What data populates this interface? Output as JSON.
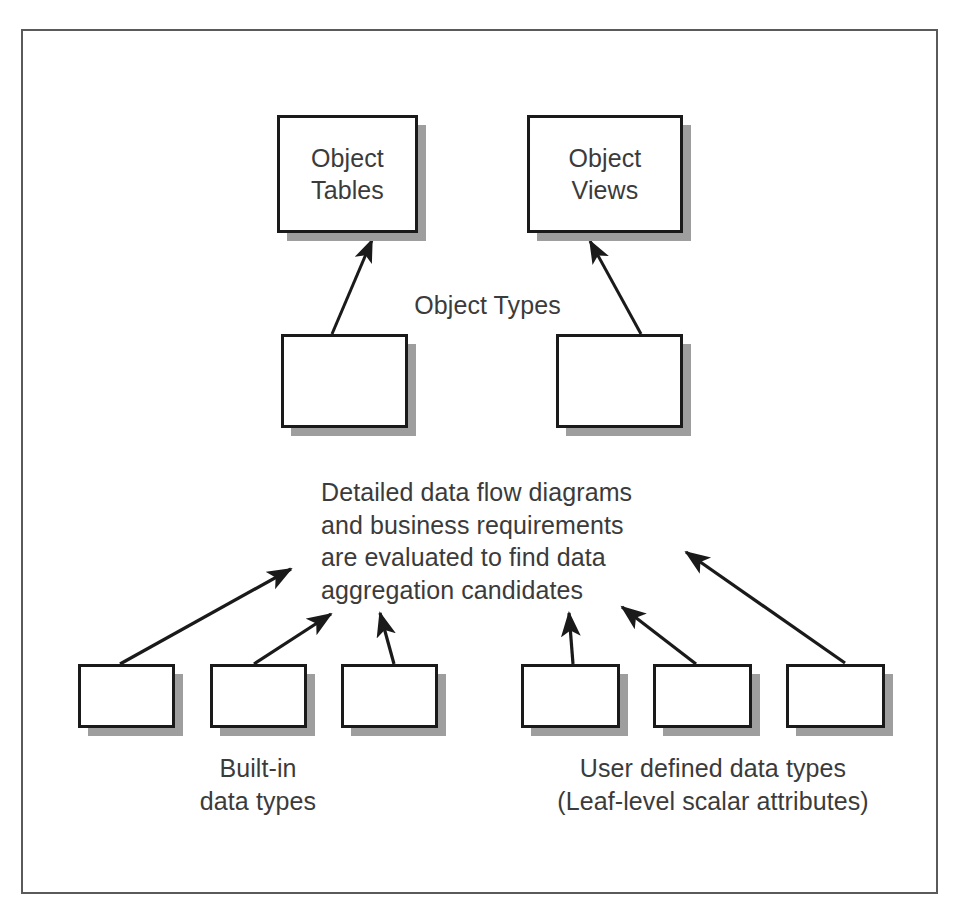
{
  "figure": {
    "type": "block-diagram",
    "background_color": "#ffffff",
    "frame_color": "#5a5a5a",
    "box_border_color": "#1a1a1a",
    "box_fill_color": "#ffffff",
    "shadow_color": "#9e9e9e",
    "text_color": "#3b3b3b",
    "arrow_color": "#1a1a1a"
  },
  "nodes": {
    "object_tables": "Object\nTables",
    "object_views": "Object\nViews",
    "object_type_left": "",
    "object_type_right": "",
    "builtin_box_1": "",
    "builtin_box_2": "",
    "builtin_box_3": "",
    "userdef_box_1": "",
    "userdef_box_2": "",
    "userdef_box_3": ""
  },
  "labels": {
    "object_types": "Object Types",
    "aggregation_note": "Detailed data flow diagrams\nand business requirements\nare evaluated to find data\naggregation candidates",
    "builtin_caption": "Built-in\ndata types",
    "userdefined_caption": "User defined data types\n(Leaf-level scalar attributes)"
  },
  "connectors": [
    {
      "name": "objecttype-left-to-object-tables",
      "from": "object_type_left",
      "to": "object_tables",
      "arrow": true
    },
    {
      "name": "objecttype-right-to-object-views",
      "from": "object_type_right",
      "to": "object_views",
      "arrow": true
    },
    {
      "name": "builtin-1-to-note",
      "from": "builtin_box_1",
      "to": "aggregation_note",
      "arrow": true
    },
    {
      "name": "builtin-2-to-note",
      "from": "builtin_box_2",
      "to": "aggregation_note",
      "arrow": true
    },
    {
      "name": "builtin-3-to-note",
      "from": "builtin_box_3",
      "to": "aggregation_note",
      "arrow": true
    },
    {
      "name": "userdef-1-to-note",
      "from": "userdef_box_1",
      "to": "aggregation_note",
      "arrow": true
    },
    {
      "name": "userdef-2-to-note",
      "from": "userdef_box_2",
      "to": "aggregation_note",
      "arrow": true
    },
    {
      "name": "userdef-3-to-note",
      "from": "userdef_box_3",
      "to": "aggregation_note",
      "arrow": true
    }
  ]
}
